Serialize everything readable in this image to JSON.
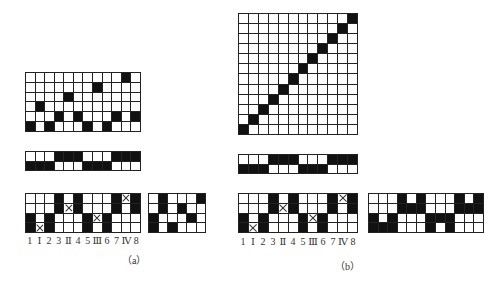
{
  "figure_a": {
    "caption": "（a）",
    "top_grid": {
      "rows": 6,
      "cols": 12,
      "cells": [
        "..........B.",
        ".......B....",
        "....B.......",
        ".B..........",
        "...B.B...B.B",
        "B.B...B.B..."
      ]
    },
    "middle_grid": {
      "rows": 2,
      "cols": 12,
      "cells": [
        "...BBB...BBB",
        "BBB...BBB..."
      ]
    },
    "bottom_grid": {
      "rows": 4,
      "cols": 12,
      "cells": [
        "...B.B...BXB",
        "...BXB...B.B",
        "B.B...BXB...",
        "BXB...B.B..."
      ]
    },
    "side_grid": {
      "rows": 4,
      "cols": 6,
      "cells": [
        ".B...B",
        ".B.B..",
        "B...B.",
        "B.B..."
      ]
    },
    "column_labels": [
      "1",
      "Ⅰ",
      "2",
      "3",
      "Ⅱ",
      "4",
      "5",
      "Ⅲ",
      "6",
      "7",
      "Ⅳ",
      "8"
    ]
  },
  "figure_b": {
    "caption": "（b）",
    "top_grid": {
      "rows": 12,
      "cols": 12,
      "cells": [
        "...........B",
        "..........B.",
        ".........B..",
        "........B...",
        ".......B....",
        "......B.....",
        ".....B......",
        "....B.......",
        "...B........",
        "..B.........",
        ".B..........",
        "B..........."
      ]
    },
    "middle_grid": {
      "rows": 2,
      "cols": 12,
      "cells": [
        "...BBB...BBB",
        "BBB...BBB..."
      ]
    },
    "bottom_grid": {
      "rows": 4,
      "cols": 12,
      "cells": [
        "...B.B...BXB",
        "...BXB...B.B",
        "B.B...BXB...",
        "BXB...B.B..."
      ]
    },
    "side_grid": {
      "rows": 4,
      "cols": 12,
      "cells": [
        "...B.B...B.B",
        "...BBB...BBB",
        "B.BWWWBBB...",
        "BBB...B.B..."
      ]
    },
    "column_labels": [
      "1",
      "Ⅰ",
      "2",
      "3",
      "Ⅱ",
      "4",
      "5",
      "Ⅲ",
      "6",
      "7",
      "Ⅳ",
      "8"
    ]
  }
}
